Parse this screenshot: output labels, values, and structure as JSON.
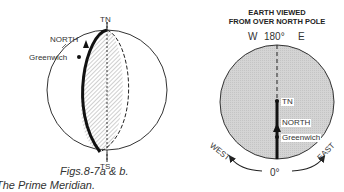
{
  "left_figure": {
    "top_label": "TN",
    "bottom_label": "TS",
    "north_label": "NORTH",
    "greenwich_label": "Greenwich"
  },
  "right_figure": {
    "title_line1": "EARTH VIEWED",
    "title_line2": "FROM OVER NORTH POLE",
    "west_top": "W",
    "degree_top": "180°",
    "east_top": "E",
    "tn_label": "TN",
    "north_label": "NORTH",
    "greenwich_label": "Greenwich",
    "west_label": "WEST",
    "east_label": "EAST",
    "degree_bottom": "0°"
  },
  "caption": {
    "line1": "Figs.8-7a & b.",
    "line2": "The Prime Meridian."
  }
}
